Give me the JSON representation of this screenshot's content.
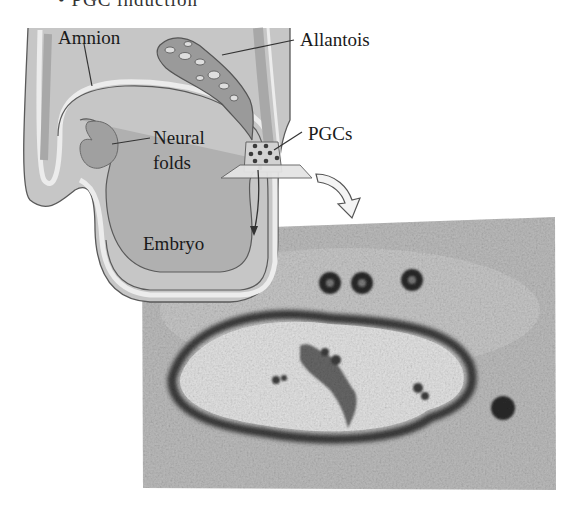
{
  "figure": {
    "title_fragment": "• PGC induction",
    "labels": {
      "amnion": "Amnion",
      "allantois": "Allantois",
      "neural_folds_line1": "Neural",
      "neural_folds_line2": "folds",
      "pgcs": "PGCs",
      "embryo": "Embryo"
    },
    "colors": {
      "tissue_fill": "#c9c9c9",
      "tissue_dark": "#a9a9a9",
      "membrane_light": "#e6e6e6",
      "outline": "#5a5a5a",
      "arrow_fill": "#f0f0f0",
      "photo_bg": "#bdbdbd",
      "photo_cavity": "#e4e4e4",
      "stain": "#2a2a2a"
    },
    "micrograph": {
      "description": "Section of embryo showing stained primordial germ cells",
      "stained_cells_count": 4
    }
  }
}
